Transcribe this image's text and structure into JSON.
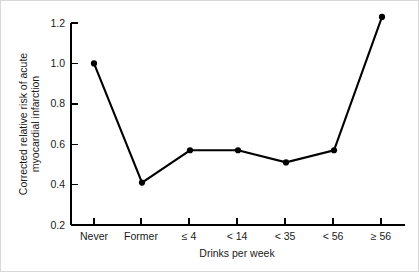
{
  "chart_data": {
    "type": "line",
    "title": "",
    "subtitle": "",
    "xlabel": "Drinks per week",
    "ylabel": "Corrected relative risk of acute myocardial infarction",
    "ylabel_line1": "Corrected relative risk of acute",
    "ylabel_line2": "myocardial infarction",
    "categories": [
      "Never",
      "Former",
      "≤ 4",
      "< 14",
      "< 35",
      "< 56",
      "≥ 56"
    ],
    "values": [
      1.0,
      0.41,
      0.57,
      0.57,
      0.51,
      0.57,
      1.23
    ],
    "series": [
      {
        "name": "Corrected relative risk",
        "values": [
          1.0,
          0.41,
          0.57,
          0.57,
          0.51,
          0.57,
          1.23
        ]
      }
    ],
    "ytick_labels": [
      "0.2",
      "0.4",
      "0.6",
      "0.8",
      "1.0",
      "1.2"
    ],
    "ytick_values": [
      0.2,
      0.4,
      0.6,
      0.8,
      1.0,
      1.2
    ],
    "ylim": [
      0.2,
      1.2
    ],
    "xlim": [
      0,
      6
    ],
    "grid": false,
    "legend": false,
    "legend_position": "none",
    "marker": "filled-circle",
    "line_color": "#000000",
    "marker_color": "#000000",
    "background_color": "#ffffff",
    "annotations": []
  }
}
